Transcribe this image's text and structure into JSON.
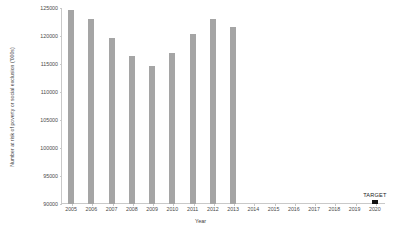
{
  "chart_data": {
    "type": "bar",
    "title": "",
    "subtitle": "",
    "xlabel": "Year",
    "ylabel": "Number at risk of poverty or social exclusion ('000s)",
    "categories": [
      "2005",
      "2006",
      "2007",
      "2008",
      "2009",
      "2010",
      "2011",
      "2012",
      "2013",
      "2014",
      "2015",
      "2016",
      "2017",
      "2018",
      "2019",
      "2020"
    ],
    "values": [
      124600,
      123000,
      119600,
      116400,
      114600,
      116900,
      120400,
      123000,
      121600,
      null,
      null,
      null,
      null,
      null,
      null,
      90800
    ],
    "ylim": [
      90000,
      125000
    ],
    "xlim": [
      "2005",
      "2020"
    ],
    "yticks": [
      90000,
      95000,
      100000,
      105000,
      110000,
      115000,
      120000,
      125000
    ],
    "ytick_labels": [
      "90000",
      "95000",
      "100000",
      "105000",
      "110000",
      "115000",
      "120000",
      "125000"
    ],
    "grid": false,
    "legend": null,
    "annotations": [
      {
        "text": "TARGET",
        "category": "2020"
      }
    ],
    "series": [
      {
        "name": "Observed",
        "color": "#a5a5a5",
        "values": [
          124600,
          123000,
          119600,
          116400,
          114600,
          116900,
          120400,
          123000,
          121600,
          null,
          null,
          null,
          null,
          null,
          null,
          null
        ]
      },
      {
        "name": "Target",
        "color": "#111111",
        "values": [
          null,
          null,
          null,
          null,
          null,
          null,
          null,
          null,
          null,
          null,
          null,
          null,
          null,
          null,
          null,
          90800
        ]
      }
    ]
  }
}
